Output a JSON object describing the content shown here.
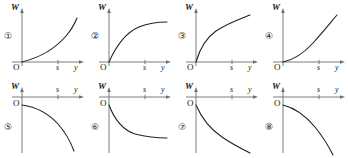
{
  "figure": {
    "axis_label_vertical": "W",
    "axis_label_origin": "O",
    "axis_tick_label_s": "s",
    "axis_label_horizontal": "y",
    "stroke_color": "#222222",
    "axis_color": "#6e6e6e",
    "panels": [
      {
        "number": "①",
        "row": "top",
        "shape": "increasing-convex",
        "description": "W increases slowly at first then steeply; convex rising curve from origin",
        "path": "M 8 52 C 24 48 40 40 52 26 C 58 19 61 13 63 8"
      },
      {
        "number": "②",
        "row": "top",
        "shape": "increasing-concave-saturating",
        "description": "W rises quickly then levels off to a horizontal asymptote",
        "path": "M 8 52 C 16 34 26 22 38 17 C 48 13 58 12 66 12"
      },
      {
        "number": "③",
        "row": "top",
        "shape": "increasing-concave",
        "description": "W rises steeply then more gradually, still increasing at the right edge",
        "path": "M 8 52 C 12 38 18 28 28 21 C 40 13 52 9 62 5"
      },
      {
        "number": "④",
        "row": "top",
        "shape": "increasing-convex",
        "description": "W increases gently then accelerates upward; convex rising curve",
        "path": "M 8 52 C 18 50 28 44 38 33 C 48 22 56 12 62 5"
      },
      {
        "number": "⑤",
        "row": "bottom",
        "shape": "decreasing-concave-accelerating",
        "description": "W falls slowly at first then plunges steeply downward",
        "path": "M 8 10 C 22 12 34 18 44 29 C 52 38 57 48 60 56"
      },
      {
        "number": "⑥",
        "row": "bottom",
        "shape": "decreasing-convex-saturating",
        "description": "W drops quickly then levels off toward a horizontal asymptote",
        "path": "M 8 10 C 14 26 22 35 34 39 C 46 42 56 43 66 43"
      },
      {
        "number": "⑦",
        "row": "bottom",
        "shape": "decreasing-convex",
        "description": "W decreases steeply then less steeply, still falling at the right edge",
        "path": "M 8 10 C 14 24 22 34 34 42 C 44 49 54 54 62 58"
      },
      {
        "number": "⑧",
        "row": "bottom",
        "shape": "decreasing-concave-accelerating",
        "description": "W decreases gently then falls away sharply downward",
        "path": "M 8 10 C 20 13 30 20 40 32 C 48 42 54 52 58 60"
      }
    ]
  }
}
